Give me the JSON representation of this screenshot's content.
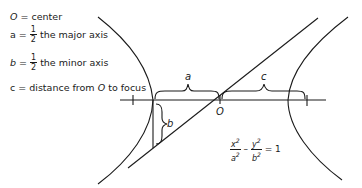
{
  "legend": {
    "center": {
      "symbol": "O",
      "text": "= center"
    },
    "major": {
      "symbol": "a",
      "eq": "=",
      "num": "1",
      "den": "2",
      "text": "the major axis"
    },
    "minor": {
      "symbol": "b",
      "eq": "=",
      "num": "1",
      "den": "2",
      "text": "the minor axis"
    },
    "focus": {
      "symbol": "c",
      "text": "= distance from",
      "ref": "O",
      "text2": "to focus"
    }
  },
  "labels": {
    "a": "a",
    "b": "b",
    "c": "c",
    "center": "O"
  },
  "equation": {
    "x_num": "x",
    "x_den": "a",
    "y_num": "y",
    "y_den": "b",
    "exp": "2",
    "minus": "–",
    "equals": "= 1"
  },
  "colors": {
    "stroke": "#1a1a1a",
    "background": "#ffffff"
  }
}
